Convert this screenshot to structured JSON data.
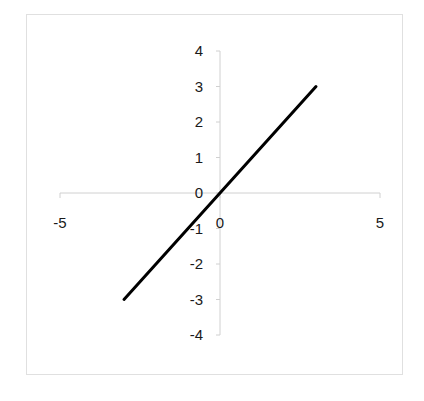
{
  "chart_data": {
    "type": "line",
    "title": "",
    "xlabel": "",
    "ylabel": "",
    "xlim": [
      -5,
      5
    ],
    "ylim": [
      -4,
      4
    ],
    "grid": false,
    "legend": null,
    "x_ticks": [
      -5,
      0,
      5
    ],
    "y_ticks": [
      4,
      3,
      2,
      1,
      0,
      -1,
      -2,
      -3,
      -4
    ],
    "x_tick_labels": [
      "-5",
      "0",
      "5"
    ],
    "y_tick_labels": [
      "4",
      "3",
      "2",
      "1",
      "0",
      "-1",
      "-2",
      "-3",
      "-4"
    ],
    "series": [
      {
        "name": "y = x",
        "x": [
          -3,
          -2,
          -1,
          0,
          1,
          2,
          3
        ],
        "y": [
          -3,
          -2,
          -1,
          0,
          1,
          2,
          3
        ],
        "color": "#000000"
      }
    ]
  },
  "style": {
    "line_color": "#000000",
    "axis_color": "#d0d0d0",
    "frame_color": "#e0e0e0"
  }
}
